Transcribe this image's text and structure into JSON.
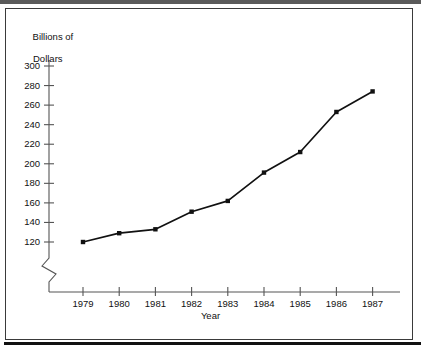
{
  "chart_data": {
    "type": "line",
    "title": "",
    "subtitle": "",
    "xlabel": "Year",
    "ylabel": "Billions of\nDollars",
    "ylabel_lines": [
      "Billions of",
      "Dollars"
    ],
    "categories": [
      "1979",
      "1980",
      "1981",
      "1982",
      "1983",
      "1984",
      "1985",
      "1986",
      "1987"
    ],
    "x": [
      1979,
      1980,
      1981,
      1982,
      1983,
      1984,
      1985,
      1986,
      1987
    ],
    "values": [
      120,
      129,
      133,
      151,
      162,
      191,
      212,
      253,
      274
    ],
    "series": [
      {
        "name": "Billions of Dollars",
        "values": [
          120,
          129,
          133,
          151,
          162,
          191,
          212,
          253,
          274
        ]
      }
    ],
    "ylim": [
      120,
      300
    ],
    "yticks": [
      120,
      140,
      160,
      180,
      200,
      220,
      240,
      260,
      280,
      300
    ],
    "ytick_labels": [
      "120",
      "140",
      "160",
      "180",
      "200",
      "220",
      "240",
      "260",
      "280",
      "300"
    ],
    "xtick_labels": [
      "1979",
      "1980",
      "1981",
      "1982",
      "1983",
      "1984",
      "1985",
      "1986",
      "1987"
    ],
    "grid": false,
    "legend": false,
    "legend_position": "none",
    "axis_break": true,
    "axis_break_note": "zigzag break on y-axis below 120",
    "marker": "filled-square",
    "line_color": "#111111",
    "marker_color": "#111111",
    "background_color": "#ffffff",
    "axis_color": "#555555"
  },
  "frame": {
    "border_color": "#3a3a3a",
    "top_band_color": "#5a5a5a",
    "bottom_rule_color": "#111111"
  }
}
